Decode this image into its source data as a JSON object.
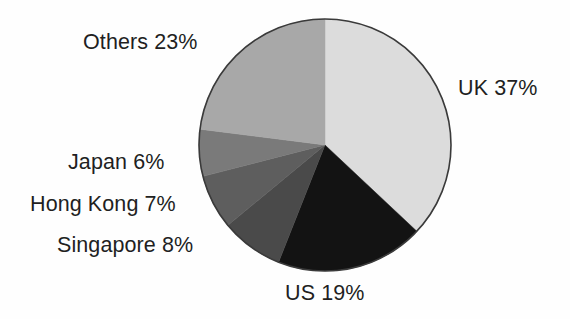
{
  "figure": {
    "background_color": "#fefefe",
    "text_color": "#221f1f"
  },
  "chart_data": {
    "type": "pie",
    "title": "",
    "subtitle": "",
    "xlabel": "",
    "ylabel": "",
    "legend_position": "none",
    "grid": false,
    "units": "percent",
    "start_angle_deg": 0,
    "direction": "clockwise",
    "center": {
      "x": 325,
      "y": 145
    },
    "radius": 126,
    "outline_color": "#3a3a3a",
    "categories": [
      "UK",
      "US",
      "Singapore",
      "Hong Kong",
      "Japan",
      "Others"
    ],
    "values": [
      37,
      19,
      8,
      7,
      6,
      23
    ],
    "colors": [
      "#dcdcdc",
      "#131313",
      "#4a4a4a",
      "#5e5e5e",
      "#7a7a7a",
      "#a8a8a8"
    ],
    "labels": [
      "UK 37%",
      "US 19%",
      "Singapore 8%",
      "Hong Kong 7%",
      "Japan 6%",
      "Others 23%"
    ],
    "slices": [
      {
        "name": "UK",
        "value": 37,
        "label": "UK 37%",
        "color": "#dcdcdc",
        "start_deg": 0.0,
        "end_deg": 133.2
      },
      {
        "name": "US",
        "value": 19,
        "label": "US 19%",
        "color": "#131313",
        "start_deg": 133.2,
        "end_deg": 201.6
      },
      {
        "name": "Singapore",
        "value": 8,
        "label": "Singapore 8%",
        "color": "#4a4a4a",
        "start_deg": 201.6,
        "end_deg": 230.4
      },
      {
        "name": "Hong Kong",
        "value": 7,
        "label": "Hong Kong 7%",
        "color": "#5e5e5e",
        "start_deg": 230.4,
        "end_deg": 255.6
      },
      {
        "name": "Japan",
        "value": 6,
        "label": "Japan 6%",
        "color": "#7a7a7a",
        "start_deg": 255.6,
        "end_deg": 277.2
      },
      {
        "name": "Others",
        "value": 23,
        "label": "Others 23%",
        "color": "#a8a8a8",
        "start_deg": 277.2,
        "end_deg": 360.0
      }
    ]
  }
}
